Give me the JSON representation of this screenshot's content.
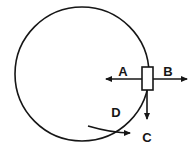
{
  "figure": {
    "background_color": "#ffffff",
    "stroke_color": "#161616",
    "label_color": "#161616"
  },
  "circle": {
    "name": "circular-path",
    "center_x": 82,
    "center_y": 74,
    "radius": 67,
    "stroke_width": 1.6,
    "fill": "none"
  },
  "block": {
    "name": "block",
    "x": 142,
    "y": 67,
    "width": 11,
    "height": 23,
    "fill": "#ffffff",
    "stroke_width": 1.6
  },
  "vectors": [
    {
      "id": "A",
      "label": "A",
      "direction": "left",
      "from_x": 142,
      "from_y": 79,
      "to_x": 103,
      "to_y": 79,
      "label_x": 123,
      "label_y": 72
    },
    {
      "id": "B",
      "label": "B",
      "direction": "right",
      "from_x": 153,
      "from_y": 79,
      "to_x": 190,
      "to_y": 79,
      "label_x": 168,
      "label_y": 72
    },
    {
      "id": "C",
      "label": "C",
      "direction": "down",
      "from_x": 147,
      "from_y": 90,
      "to_x": 147,
      "to_y": 122,
      "label_x": 147,
      "label_y": 138
    },
    {
      "id": "D",
      "label": "D",
      "direction": "tangential-down-right",
      "from_x": 100,
      "from_y": 122,
      "to_x": 133,
      "to_y": 135,
      "label_x": 116,
      "label_y": 113
    }
  ],
  "labels": {
    "A": "A",
    "B": "B",
    "C": "C",
    "D": "D"
  }
}
